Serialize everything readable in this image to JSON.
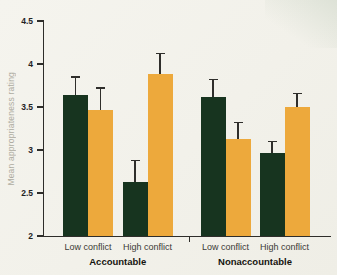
{
  "figure": {
    "background": "#f2f1ea",
    "corner_shading_color": "#a7baa4"
  },
  "chart_data": {
    "type": "bar",
    "title": "",
    "xlabel": "",
    "ylabel": "Mean appropriateness rating",
    "ylim": [
      2,
      4.5
    ],
    "ytick_labels": [
      "2",
      "2.5",
      "3",
      "3.5",
      "4",
      "4.5"
    ],
    "ytick_values": [
      2,
      2.5,
      3,
      3.5,
      4,
      4.5
    ],
    "grid": false,
    "legend": "none",
    "error_bars": "upper-only",
    "axis_color": "#2e2d2a",
    "tick_label_color": "#23221f",
    "ylabel_color": "#aeaca1",
    "series": [
      {
        "name": "dark-green",
        "color": "#17341f"
      },
      {
        "name": "orange",
        "color": "#eda93c"
      }
    ],
    "groups": [
      {
        "label": "Accountable",
        "conditions": [
          {
            "label": "Low conflict",
            "values": [
              3.64,
              3.46
            ],
            "errors": [
              0.21,
              0.26
            ]
          },
          {
            "label": "High conflict",
            "values": [
              2.63,
              3.88
            ],
            "errors": [
              0.25,
              0.24
            ]
          }
        ]
      },
      {
        "label": "Nonaccountable",
        "conditions": [
          {
            "label": "Low conflict",
            "values": [
              3.62,
              3.13
            ],
            "errors": [
              0.2,
              0.19
            ]
          },
          {
            "label": "High conflict",
            "values": [
              2.96,
              3.5
            ],
            "errors": [
              0.14,
              0.16
            ]
          }
        ]
      }
    ]
  }
}
